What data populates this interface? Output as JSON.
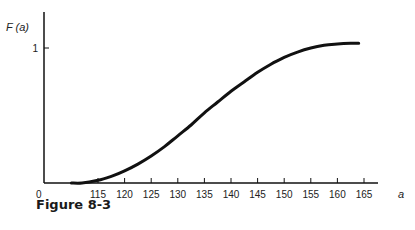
{
  "chart_data": {
    "type": "line",
    "title": "",
    "caption": "Figure 8-3",
    "xlabel": "a",
    "ylabel": "F (a)",
    "x_origin_label": "0",
    "x_ticks": [
      115,
      120,
      125,
      130,
      135,
      140,
      145,
      150,
      155,
      160,
      165
    ],
    "y_ticks": [
      1
    ],
    "xlim": [
      107,
      168
    ],
    "ylim": [
      0,
      1.15
    ],
    "grid": false,
    "legend": null,
    "series": [
      {
        "name": "F(a)",
        "x": [
          110,
          112,
          115,
          117.5,
          120,
          122.5,
          125,
          127.5,
          130,
          132.5,
          135,
          137.5,
          140,
          142.5,
          145,
          147.5,
          150,
          152.5,
          155,
          157.5,
          160,
          162.5,
          164
        ],
        "y": [
          0.0,
          0.0,
          0.02,
          0.05,
          0.09,
          0.14,
          0.2,
          0.27,
          0.35,
          0.43,
          0.52,
          0.6,
          0.68,
          0.75,
          0.82,
          0.88,
          0.93,
          0.97,
          1.0,
          1.02,
          1.03,
          1.035,
          1.035
        ]
      }
    ]
  }
}
